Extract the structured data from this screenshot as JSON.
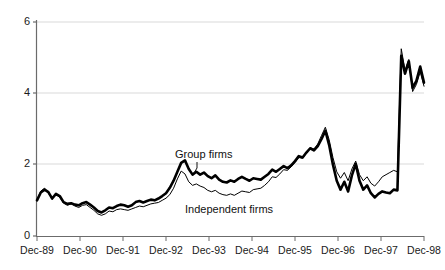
{
  "chart_data": {
    "type": "line",
    "title": "",
    "xlabel": "",
    "ylabel": "",
    "ylim": [
      0,
      6
    ],
    "yticks": [
      0,
      2,
      4,
      6
    ],
    "ytick_labels": [
      "0",
      "2",
      "4",
      "6"
    ],
    "grid": "horizontal",
    "legend": "inline-annotations",
    "x_tick_labels": [
      "Dec-89",
      "Dec-90",
      "Dec-91",
      "Dec-92",
      "Dec-93",
      "Dec-94",
      "Dec-95",
      "Dec-96",
      "Dec-97",
      "Dec-98"
    ],
    "x_range_start": "Dec-89",
    "x_range_end": "Dec-99",
    "annotations": [
      {
        "text": "Group firms",
        "series": "Group firms"
      },
      {
        "text": "Independent firms",
        "series": "Independent firms"
      }
    ],
    "series": [
      {
        "name": "Group firms",
        "style": "thick-black",
        "color": "#000000",
        "line_width": 2.6,
        "values": [
          1.0,
          1.22,
          1.3,
          1.23,
          1.05,
          1.18,
          1.12,
          0.95,
          0.9,
          0.92,
          0.88,
          0.86,
          0.92,
          0.95,
          0.88,
          0.8,
          0.7,
          0.66,
          0.72,
          0.8,
          0.78,
          0.84,
          0.88,
          0.86,
          0.82,
          0.86,
          0.95,
          0.98,
          0.94,
          0.98,
          1.02,
          1.0,
          1.05,
          1.12,
          1.2,
          1.35,
          1.55,
          1.8,
          2.05,
          2.12,
          1.88,
          1.72,
          1.8,
          1.72,
          1.78,
          1.68,
          1.62,
          1.7,
          1.58,
          1.52,
          1.5,
          1.56,
          1.52,
          1.6,
          1.66,
          1.6,
          1.55,
          1.62,
          1.6,
          1.58,
          1.66,
          1.74,
          1.86,
          1.8,
          1.88,
          1.96,
          1.9,
          1.98,
          2.1,
          2.24,
          2.2,
          2.34,
          2.46,
          2.4,
          2.52,
          2.72,
          2.95,
          2.55,
          2.0,
          1.55,
          1.3,
          1.52,
          1.25,
          1.7,
          2.02,
          1.55,
          1.3,
          1.42,
          1.2,
          1.08,
          1.18,
          1.25,
          1.22,
          1.2,
          1.3,
          1.28,
          5.05,
          4.55,
          4.9,
          4.15,
          4.35,
          4.75,
          4.3
        ]
      },
      {
        "name": "Independent firms",
        "style": "thin-black",
        "color": "#000000",
        "line_width": 1.0,
        "values": [
          1.02,
          1.26,
          1.34,
          1.2,
          1.04,
          1.16,
          1.08,
          0.92,
          0.86,
          0.9,
          0.84,
          0.8,
          0.86,
          0.88,
          0.8,
          0.72,
          0.62,
          0.58,
          0.62,
          0.7,
          0.68,
          0.74,
          0.76,
          0.74,
          0.72,
          0.76,
          0.8,
          0.84,
          0.82,
          0.86,
          0.9,
          0.92,
          0.94,
          1.0,
          1.06,
          1.16,
          1.34,
          1.6,
          1.82,
          1.74,
          1.52,
          1.42,
          1.46,
          1.4,
          1.36,
          1.28,
          1.24,
          1.28,
          1.2,
          1.16,
          1.14,
          1.18,
          1.14,
          1.2,
          1.26,
          1.24,
          1.22,
          1.3,
          1.32,
          1.34,
          1.42,
          1.52,
          1.66,
          1.64,
          1.74,
          1.86,
          1.84,
          1.94,
          2.06,
          2.2,
          2.18,
          2.32,
          2.48,
          2.44,
          2.58,
          2.82,
          3.05,
          2.7,
          2.2,
          1.8,
          1.62,
          1.78,
          1.55,
          1.88,
          2.1,
          1.72,
          1.55,
          1.66,
          1.48,
          1.4,
          1.52,
          1.66,
          1.72,
          1.78,
          1.84,
          1.8,
          5.25,
          4.65,
          4.95,
          4.05,
          4.25,
          4.6,
          4.2
        ]
      }
    ]
  },
  "axes": {
    "y_labels": [
      "6",
      "4",
      "2",
      "0"
    ],
    "x_labels": [
      "Dec-89",
      "Dec-90",
      "Dec-91",
      "Dec-92",
      "Dec-93",
      "Dec-94",
      "Dec-95",
      "Dec-96",
      "Dec-97",
      "Dec-98"
    ]
  },
  "annotations": {
    "group": "Group firms",
    "independent": "Independent firms"
  },
  "colors": {
    "line": "#000000",
    "axis": "#6b6b6b",
    "grid": "#d9d9d9",
    "text": "#1a1a1a",
    "background": "#ffffff"
  }
}
